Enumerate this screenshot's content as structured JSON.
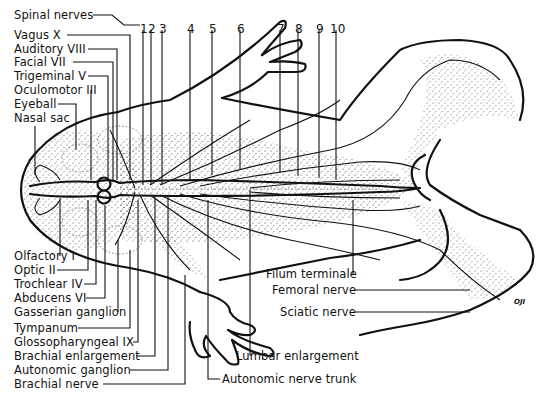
{
  "figure": {
    "signature": "OJI"
  },
  "numbers_top": [
    {
      "n": "1",
      "x": 143
    },
    {
      "n": "2",
      "x": 151
    },
    {
      "n": "3",
      "x": 162
    },
    {
      "n": "4",
      "x": 190
    },
    {
      "n": "5",
      "x": 212
    },
    {
      "n": "6",
      "x": 240
    },
    {
      "n": "7",
      "x": 280
    },
    {
      "n": "8",
      "x": 298
    },
    {
      "n": "9",
      "x": 319
    },
    {
      "n": "10",
      "x": 336
    }
  ],
  "labels_left_top": [
    {
      "text": "Spinal nerves",
      "y": 9
    },
    {
      "text": "Vagus X",
      "y": 29
    },
    {
      "text": "Auditory VIII",
      "y": 43
    },
    {
      "text": "Facial VII",
      "y": 56
    },
    {
      "text": "Trigeminal V",
      "y": 70
    },
    {
      "text": "Oculomotor III",
      "y": 84
    },
    {
      "text": "Eyeball",
      "y": 98
    },
    {
      "text": "Nasal sac",
      "y": 112
    }
  ],
  "labels_left_bottom": [
    {
      "text": "Olfactory I",
      "y": 250
    },
    {
      "text": "Optic II",
      "y": 264
    },
    {
      "text": "Trochlear IV",
      "y": 278
    },
    {
      "text": "Abducens VI",
      "y": 292
    },
    {
      "text": "Gasserian ganglion",
      "y": 306
    },
    {
      "text": "Tympanum",
      "y": 322
    },
    {
      "text": "Glossopharyngeal IX",
      "y": 336
    },
    {
      "text": "Brachial enlargement",
      "y": 350
    },
    {
      "text": "Autonomic ganglion",
      "y": 364
    },
    {
      "text": "Brachial nerve",
      "y": 378
    }
  ],
  "labels_right": [
    {
      "text": "Filum terminale",
      "x": 266,
      "y": 268
    },
    {
      "text": "Femoral nerve",
      "x": 272,
      "y": 283
    },
    {
      "text": "Sciatic nerve",
      "x": 280,
      "y": 306
    }
  ],
  "labels_bottom": [
    {
      "text": "Lumbar enlargement",
      "x": 236,
      "y": 350
    },
    {
      "text": "Autonomic nerve trunk",
      "x": 222,
      "y": 373
    }
  ]
}
